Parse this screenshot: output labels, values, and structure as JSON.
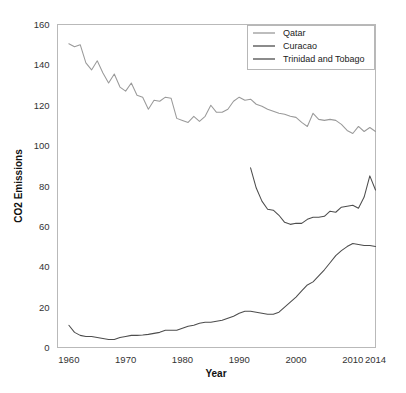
{
  "chart_data": {
    "type": "line",
    "title": "",
    "xlabel": "Year",
    "ylabel": "CO2 Emissions",
    "xlim": [
      1958,
      2014
    ],
    "ylim": [
      0,
      160
    ],
    "xticks": [
      1960,
      1970,
      1980,
      1990,
      2000,
      2010,
      2014
    ],
    "yticks": [
      0,
      20,
      40,
      60,
      80,
      100,
      120,
      140,
      160
    ],
    "grid": false,
    "legend_position": "top-right",
    "legend_entries": [
      "Qatar",
      "Curacao",
      "Trinidad and Tobago"
    ],
    "colors": {
      "Qatar": "#9a9a9a",
      "Curacao": "#4d4d4d",
      "Trinidad and Tobago": "#4d4d4d",
      "frame": "#b9b9b9",
      "text": "#1a1a1a"
    },
    "series": [
      {
        "name": "Qatar",
        "color": "#9a9a9a",
        "x": [
          1960,
          1961,
          1962,
          1963,
          1964,
          1965,
          1966,
          1967,
          1968,
          1969,
          1970,
          1971,
          1972,
          1973,
          1974,
          1975,
          1976,
          1977,
          1978,
          1979,
          1980,
          1981,
          1982,
          1983,
          1984,
          1985,
          1986,
          1987,
          1988,
          1989,
          1990,
          1991,
          1992,
          1993,
          1994,
          1995,
          1996,
          1997,
          1998,
          1999,
          2000,
          2001,
          2002,
          2003,
          2004,
          2005,
          2006,
          2007,
          2008,
          2009,
          2010,
          2011,
          2012,
          2013,
          2014
        ],
        "y": [
          150.5,
          149.0,
          150.0,
          141.0,
          137.5,
          142.0,
          136.0,
          131.0,
          135.5,
          129.0,
          127.0,
          131.0,
          125.0,
          124.0,
          118.0,
          122.5,
          122.0,
          124.0,
          123.5,
          113.5,
          112.5,
          111.5,
          114.5,
          112.0,
          114.5,
          120.0,
          116.5,
          116.5,
          118.0,
          122.0,
          124.0,
          122.5,
          123.0,
          120.5,
          119.5,
          118.0,
          117.0,
          116.0,
          115.5,
          114.5,
          114.0,
          111.5,
          109.5,
          116.0,
          113.0,
          112.5,
          113.0,
          112.5,
          110.5,
          107.5,
          106.0,
          109.5,
          107.0,
          109.0,
          107.0
        ]
      },
      {
        "name": "Curacao",
        "color": "#4d4d4d",
        "x": [
          1992,
          1993,
          1994,
          1995,
          1996,
          1997,
          1998,
          1999,
          2000,
          2001,
          2002,
          2003,
          2004,
          2005,
          2006,
          2007,
          2008,
          2009,
          2010,
          2011,
          2012,
          2013,
          2014
        ],
        "y": [
          89.0,
          79.0,
          72.5,
          68.5,
          68.0,
          65.5,
          62.0,
          61.0,
          61.5,
          61.5,
          63.5,
          64.5,
          64.5,
          65.0,
          67.5,
          67.0,
          69.5,
          70.0,
          70.5,
          69.0,
          74.5,
          85.0,
          78.0
        ]
      },
      {
        "name": "Trinidad and Tobago",
        "color": "#4d4d4d",
        "x": [
          1960,
          1961,
          1962,
          1963,
          1964,
          1965,
          1966,
          1967,
          1968,
          1969,
          1970,
          1971,
          1972,
          1973,
          1974,
          1975,
          1976,
          1977,
          1978,
          1979,
          1980,
          1981,
          1982,
          1983,
          1984,
          1985,
          1986,
          1987,
          1988,
          1989,
          1990,
          1991,
          1992,
          1993,
          1994,
          1995,
          1996,
          1997,
          1998,
          1999,
          2000,
          2001,
          2002,
          2003,
          2004,
          2005,
          2006,
          2007,
          2008,
          2009,
          2010,
          2011,
          2012,
          2013,
          2014
        ],
        "y": [
          11.0,
          7.5,
          6.0,
          5.5,
          5.5,
          5.0,
          4.5,
          4.0,
          4.0,
          5.0,
          5.5,
          6.0,
          6.0,
          6.2,
          6.5,
          7.0,
          7.5,
          8.5,
          8.5,
          8.5,
          9.5,
          10.5,
          11.0,
          12.0,
          12.5,
          12.5,
          13.0,
          13.5,
          14.5,
          15.5,
          17.0,
          18.0,
          18.0,
          17.5,
          17.0,
          16.5,
          16.5,
          17.5,
          20.0,
          22.5,
          25.0,
          28.0,
          31.0,
          32.5,
          35.5,
          38.5,
          42.0,
          45.5,
          48.0,
          50.0,
          51.5,
          51.0,
          50.5,
          50.5,
          50.0
        ]
      }
    ]
  },
  "axes": {
    "y_title": "CO2 Emissions",
    "x_title": "Year"
  }
}
